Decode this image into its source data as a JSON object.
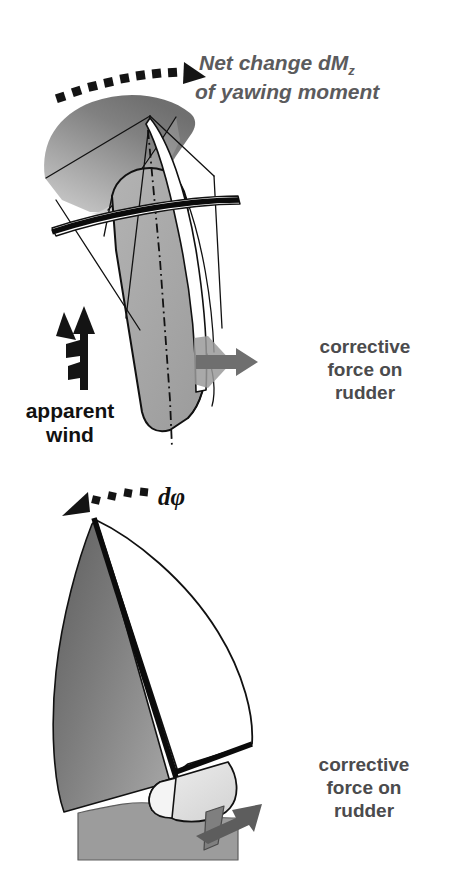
{
  "figure": {
    "background_color": "#ffffff",
    "width": 455,
    "height": 894
  },
  "palette": {
    "heading_gray": "#5b5b5d",
    "label_gray": "#4b4b4d",
    "label_black": "#111111",
    "outline_black": "#111111",
    "sail_gray_light": "#b9b9b9",
    "sail_gray_mid": "#8f8f8f",
    "sail_gray_dark": "#6e6e6e",
    "hull_gray": "#a8a8a8",
    "hull_light": "#dcdcdc",
    "water_gray": "#9c9c9c",
    "arrow_gray": "#6f6f6f",
    "arrow_gray_dark": "#5d5d5d"
  },
  "panels": [
    {
      "id": "top-view-panel",
      "name": "plan-view-of-yacht",
      "labels": {
        "moment": {
          "line1": "Net change dM",
          "subscript": "z",
          "line2": "of yawing moment",
          "style": "bold-italic",
          "color": "#5b5b5d"
        },
        "rudder_force": {
          "line1": "corrective",
          "line2": "force on",
          "line3": "rudder",
          "style": "bold",
          "color": "#4b4b4d"
        },
        "apparent_wind": {
          "line1": "apparent",
          "line2": "wind",
          "style": "bold",
          "color": "#111111"
        }
      },
      "arrows": [
        {
          "name": "yaw-moment-arc-arrow",
          "style": "dashed-arc",
          "direction": "clockwise-to-right",
          "color": "#111111"
        },
        {
          "name": "rudder-force-arrow",
          "style": "solid-block",
          "direction": "right",
          "color": "#6f6f6f"
        },
        {
          "name": "apparent-wind-barb",
          "style": "wind-barb",
          "direction": "up",
          "color": "#111111"
        }
      ]
    },
    {
      "id": "side-view-panel",
      "name": "side-view-of-yacht",
      "labels": {
        "heel_angle": {
          "text": "dφ",
          "style": "bold-italic",
          "color": "#111111"
        },
        "rudder_force": {
          "line1": "corrective",
          "line2": "force on",
          "line3": "rudder",
          "style": "bold",
          "color": "#4b4b4d"
        }
      },
      "arrows": [
        {
          "name": "heel-arc-arrow",
          "style": "dashed-arc",
          "direction": "counter-clockwise-to-left",
          "color": "#111111"
        },
        {
          "name": "rudder-force-arrow",
          "style": "solid-block",
          "direction": "up-right",
          "color": "#5d5d5d"
        }
      ],
      "parts": [
        {
          "name": "jib-sail",
          "fill": "gradient-gray"
        },
        {
          "name": "mainsail",
          "fill": "#ffffff"
        },
        {
          "name": "mast",
          "fill": "#0b0b0b"
        },
        {
          "name": "hull",
          "fill": "#e4e4e4"
        },
        {
          "name": "water",
          "fill": "#9c9c9c"
        },
        {
          "name": "rudder-blade",
          "fill": "#8a8a8a"
        }
      ]
    }
  ]
}
